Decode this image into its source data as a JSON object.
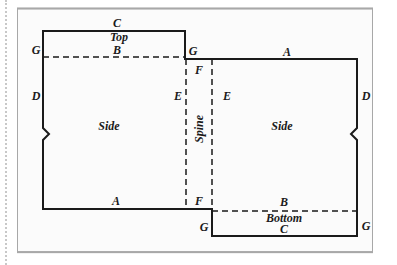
{
  "diagram": {
    "type": "book-cover-pattern",
    "colors": {
      "line": "#1a1a1a",
      "frame_border": "#a8a8a8",
      "frame_bg": "#fbfbfb",
      "dotted_rule": "#c8c8c8"
    },
    "panels": {
      "top": "Top",
      "left_side": "Side",
      "spine": "Spine",
      "right_side": "Side",
      "bottom": "Bottom"
    },
    "edge_labels": {
      "top_c": "C",
      "top_b": "B",
      "top_left_g": "G",
      "top_right_g": "G",
      "top_a": "A",
      "left_d": "D",
      "right_d": "D",
      "left_e": "E",
      "right_e": "E",
      "top_f": "F",
      "bottom_f": "F",
      "bottom_a": "A",
      "bottom_b": "B",
      "bottom_c": "C",
      "bottom_left_g": "G",
      "bottom_right_g": "G"
    }
  }
}
